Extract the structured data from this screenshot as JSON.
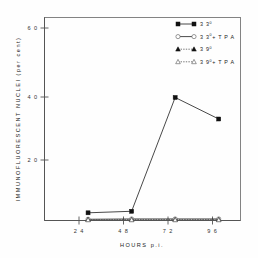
{
  "chart_data": {
    "type": "line",
    "title": "",
    "xlabel": "HOURS  p.i.",
    "ylabel": "IMMUNOFLUORESCENT  NUCLEI  (per cent)",
    "x": [
      24,
      48,
      72,
      96
    ],
    "xlim": [
      0,
      108
    ],
    "ylim": [
      0,
      66
    ],
    "xticks": [
      24,
      48,
      72,
      96
    ],
    "xticklabels": [
      "2 4",
      "4 8",
      "7 2",
      "9 6"
    ],
    "yticks": [
      20,
      40,
      60
    ],
    "yticklabels": [
      "2 0",
      "4 0",
      "6 0"
    ],
    "grid": false,
    "legend_position": "top-right",
    "series": [
      {
        "name": "33°",
        "label_base": "3 3",
        "label_sup": "0",
        "label_tail": "",
        "marker": "filled-square",
        "line": "solid",
        "values": [
          2.5,
          3.0,
          40.0,
          33.0
        ]
      },
      {
        "name": "33°+TPA",
        "label_base": "3 3",
        "label_sup": "0",
        "label_tail": "+ T P A",
        "marker": "open-circle",
        "line": "solid",
        "values": [
          0.4,
          0.5,
          0.5,
          0.5
        ]
      },
      {
        "name": "39°",
        "label_base": "3 9",
        "label_sup": "0",
        "label_tail": "",
        "marker": "filled-triangle",
        "line": "dotted",
        "values": [
          0.3,
          0.3,
          0.3,
          0.3
        ]
      },
      {
        "name": "39°+TPA",
        "label_base": "3 9",
        "label_sup": "0",
        "label_tail": "+  T P A",
        "marker": "open-triangle",
        "line": "dotted",
        "values": [
          0.2,
          0.2,
          0.2,
          0.2
        ]
      }
    ]
  },
  "figure": {
    "background_color": "#fefefe",
    "axis_color": "#555555",
    "line_color": "#1a1a1a"
  }
}
